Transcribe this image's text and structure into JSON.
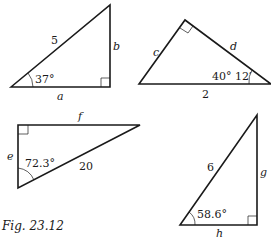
{
  "figure": {
    "caption": "Fig. 23.12",
    "triangles": [
      {
        "id": 1,
        "hypotenuse_label": "5",
        "vertical_leg_label": "b",
        "horizontal_leg_label": "a",
        "angle_label": "37°",
        "right_angle": "bottom-right"
      },
      {
        "id": 2,
        "left_side_label": "c",
        "right_side_label": "d",
        "base_label": "2",
        "angle_label": "40° 12′",
        "right_angle": "top"
      },
      {
        "id": 3,
        "top_side_label": "f",
        "left_side_label": "e",
        "hypotenuse_label": "20",
        "angle_label": "72.3°",
        "right_angle": "top-left"
      },
      {
        "id": 4,
        "hypotenuse_label": "6",
        "vertical_leg_label": "g",
        "horizontal_leg_label": "h",
        "angle_label": "58.6°",
        "right_angle": "bottom-right"
      }
    ]
  },
  "colors": {
    "stroke": "#1a1a1a",
    "background": "#ffffff"
  }
}
